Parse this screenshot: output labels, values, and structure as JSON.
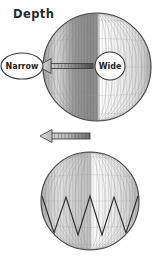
{
  "figure": {
    "title": "Depth",
    "background_color": "#ffffff",
    "outline_color": "#4a4a4a",
    "label_text_color": "#1d1d1d",
    "arrow_color": "#8a8a8a",
    "zigzag_color": "#2e2e2e"
  },
  "labels": {
    "narrow": "Narrow",
    "wide": "Wide"
  },
  "panels": [
    {
      "id": "top-panel",
      "sphere": {
        "center_x": 97,
        "center_y": 67,
        "radius": 54,
        "shading": "banded-meridian-stripes",
        "meridian_count": 13,
        "parallel_count": 5
      },
      "arrow": {
        "direction": "left",
        "from_x": 93,
        "to_x": 41,
        "y": 66,
        "shaft_thickness": 5,
        "head_width": 13,
        "head_height": 15,
        "style": "gradient-shaft"
      },
      "callouts": [
        {
          "name": "narrow",
          "shape": "ellipse",
          "cx": 22,
          "cy": 66,
          "rx": 21,
          "ry": 13,
          "label_key": "narrow"
        },
        {
          "name": "wide",
          "shape": "circle",
          "cx": 110,
          "cy": 66,
          "rx": 15,
          "ry": 14,
          "label_key": "wide"
        }
      ]
    },
    {
      "id": "bottom-panel",
      "sphere": {
        "center_x": 90,
        "center_y": 201,
        "radius": 49,
        "shading": "banded-meridian-stripes",
        "meridian_count": 13,
        "parallel_count": 5,
        "overlay": "zigzag-v-pattern",
        "zigzag_peaks": 4
      },
      "arrow": {
        "direction": "left",
        "from_x": 90,
        "to_x": 42,
        "y": 136,
        "shaft_thickness": 6,
        "head_width": 11,
        "head_height": 13,
        "style": "segmented-shaft"
      },
      "callouts": []
    }
  ]
}
